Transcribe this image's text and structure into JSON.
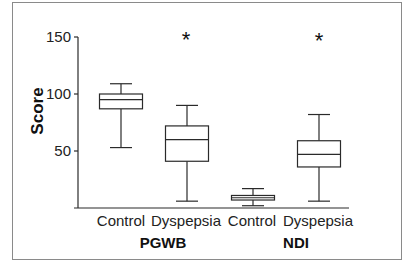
{
  "chart_data": {
    "type": "box",
    "title": "",
    "xlabel": "",
    "ylabel": "Score",
    "ylim": [
      0,
      150
    ],
    "yticks": [
      50,
      100,
      150
    ],
    "grid": false,
    "legend": null,
    "groups": [
      {
        "name": "PGWB",
        "categories": [
          "Control",
          "Dyspepsia"
        ]
      },
      {
        "name": "NDI",
        "categories": [
          "Control",
          "Dyspepsia"
        ]
      }
    ],
    "categories": [
      "Control",
      "Dyspepsia",
      "Control",
      "Dyspepsia"
    ],
    "series": [
      {
        "group": "PGWB",
        "name": "Control",
        "min": 53,
        "q1": 87,
        "median": 95,
        "q3": 100,
        "max": 109,
        "significant": false
      },
      {
        "group": "PGWB",
        "name": "Dyspepsia",
        "min": 6,
        "q1": 41,
        "median": 60,
        "q3": 72,
        "max": 90,
        "significant": true
      },
      {
        "group": "NDI",
        "name": "Control",
        "min": 2,
        "q1": 7,
        "median": 9,
        "q3": 11,
        "max": 17,
        "significant": false
      },
      {
        "group": "NDI",
        "name": "Dyspepsia",
        "min": 6,
        "q1": 36,
        "median": 47,
        "q3": 59,
        "max": 82,
        "significant": true
      }
    ],
    "annotations": [
      {
        "text": "*",
        "target": "PGWB Dyspepsia"
      },
      {
        "text": "*",
        "target": "NDI Dyspepsia"
      }
    ]
  },
  "layout": {
    "y0_px": 208,
    "px_per_unit": 1.14,
    "axis_x": 78,
    "axis_top": 37,
    "axis_right": 349,
    "box_centers": [
      121,
      187,
      253,
      319
    ],
    "box_half_width": 21.5,
    "cap_half_width": 11,
    "sig_y": 44
  },
  "labels": {
    "ylabel": "Score",
    "tick_150": "150",
    "tick_100": "100",
    "tick_50": "50",
    "cat_0": "Control",
    "cat_1": "Dyspepsia",
    "cat_2": "Control",
    "cat_3": "Dyspepsia",
    "group_0": "PGWB",
    "group_1": "NDI",
    "sig_1": "*",
    "sig_3": "*"
  }
}
